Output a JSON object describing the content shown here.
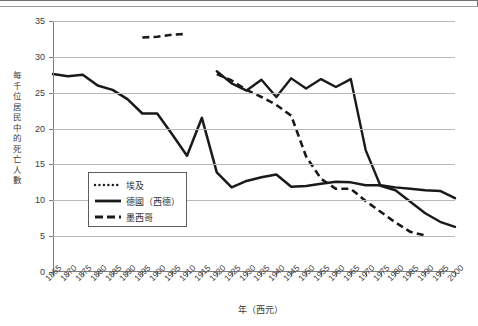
{
  "figure": {
    "axis_titles": {
      "y": "每千位居民中的死亡人數",
      "x": "年（西元）"
    }
  },
  "legend": {
    "items": [
      {
        "label": "埃及",
        "style": "dotted",
        "color": "#1a1a1a",
        "key_name": "legend-key-egypt"
      },
      {
        "label": "德國（西德）",
        "style": "solid",
        "color": "#1a1a1a",
        "key_name": "legend-key-germany"
      },
      {
        "label": "墨西哥",
        "style": "dashed",
        "color": "#1a1a1a",
        "key_name": "legend-key-mexico"
      }
    ]
  },
  "chart_data": {
    "type": "line",
    "title": "",
    "xlabel": "年（西元）",
    "ylabel": "每千位居民中的死亡人數",
    "xlim": [
      1865,
      2000
    ],
    "ylim": [
      0,
      35
    ],
    "ytick_values": [
      0,
      5,
      10,
      15,
      20,
      25,
      30,
      35
    ],
    "ytick_labels": [
      "0",
      "5",
      "10",
      "15",
      "20",
      "25",
      "30",
      "35"
    ],
    "xtick_labels": [
      "1865",
      "1870",
      "1875",
      "1880",
      "1885",
      "1890",
      "1895",
      "1900",
      "1905",
      "1910",
      "1915",
      "1920",
      "1925",
      "1930",
      "1935",
      "1940",
      "1945",
      "1950",
      "1955",
      "1960",
      "1965",
      "1970",
      "1975",
      "1980",
      "1985",
      "1990",
      "1995",
      "2000"
    ],
    "grid": "horizontal",
    "legend_position": "inside-lower-left",
    "series": [
      {
        "name": "埃及",
        "style": "dotted",
        "color": "#1a1a1a",
        "x": [
          1920,
          1925,
          1930,
          1935,
          1940,
          1945,
          1950,
          1955,
          1960,
          1965,
          1970,
          1975,
          1980,
          1985,
          1990,
          1995,
          2000
        ],
        "values": [
          28.0,
          26.3,
          25.3,
          26.8,
          24.4,
          27.0,
          25.6,
          26.9,
          25.8,
          26.9,
          17.0,
          12.0,
          11.4,
          9.8,
          8.2,
          7.0,
          6.3
        ]
      },
      {
        "name": "德國（西德）",
        "style": "solid",
        "color": "#1a1a1a",
        "x": [
          1865,
          1870,
          1875,
          1880,
          1885,
          1890,
          1895,
          1900,
          1905,
          1910,
          1915,
          1920,
          1925,
          1930,
          1935,
          1940,
          1945,
          1950,
          1955,
          1960,
          1965,
          1970,
          1975,
          1980,
          1985,
          1990,
          1995,
          2000
        ],
        "values": [
          27.6,
          27.3,
          27.5,
          26.0,
          25.4,
          24.1,
          22.1,
          22.1,
          19.2,
          16.2,
          21.5,
          13.9,
          11.8,
          12.7,
          13.2,
          13.6,
          11.9,
          12.0,
          12.3,
          12.6,
          12.5,
          12.1,
          12.1,
          11.8,
          11.6,
          11.4,
          11.3,
          10.3
        ]
      },
      {
        "name": "墨西哥",
        "style": "dashed",
        "color": "#1a1a1a",
        "segments": [
          {
            "x": [
              1895,
              1900,
              1905,
              1910
            ],
            "values": [
              32.7,
              32.8,
              33.1,
              33.2
            ]
          },
          {
            "x": [
              1920,
              1925,
              1930,
              1935,
              1940,
              1945,
              1950,
              1955,
              1960,
              1965,
              1970,
              1975,
              1980,
              1985,
              1990
            ],
            "values": [
              27.6,
              26.7,
              25.4,
              24.4,
              23.3,
              21.8,
              16.1,
              13.0,
              11.6,
              11.6,
              9.9,
              8.4,
              6.9,
              5.6,
              5.1
            ]
          }
        ]
      }
    ]
  }
}
